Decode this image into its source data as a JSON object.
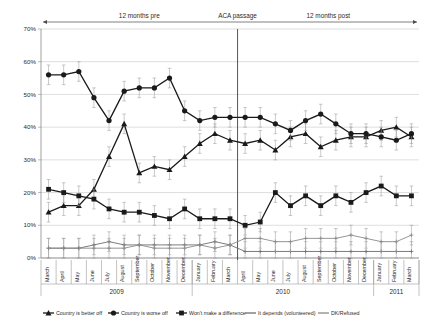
{
  "chart_data": {
    "type": "line",
    "title": "",
    "xlabel": "",
    "ylabel": "",
    "ylim": [
      0,
      70
    ],
    "ytick_labels": [
      "0%",
      "10%",
      "20%",
      "30%",
      "40%",
      "50%",
      "60%",
      "70%"
    ],
    "ytick_values": [
      0,
      10,
      20,
      30,
      40,
      50,
      60,
      70
    ],
    "grid": true,
    "legend_position": "bottom",
    "categories": [
      "March",
      "April",
      "May",
      "June",
      "July",
      "August",
      "September",
      "October",
      "November",
      "December",
      "January",
      "February",
      "March",
      "April",
      "May",
      "June",
      "July",
      "August",
      "September",
      "October",
      "November",
      "December",
      "January",
      "February",
      "March"
    ],
    "year_groups": [
      {
        "label": "2009",
        "start": 0,
        "end": 9
      },
      {
        "label": "2010",
        "start": 10,
        "end": 21
      },
      {
        "label": "2011",
        "start": 22,
        "end": 24
      }
    ],
    "annotations": [
      {
        "label": "12 months pre",
        "type": "period"
      },
      {
        "label": "ACA passage",
        "type": "marker",
        "index": 13
      },
      {
        "label": "12 months post",
        "type": "period"
      }
    ],
    "series": [
      {
        "name": "Country is better off",
        "marker": "triangle",
        "color": "#1a1a1a",
        "values": [
          14,
          16,
          16,
          21,
          31,
          41,
          26,
          28,
          27,
          31,
          35,
          38,
          36,
          35,
          36,
          33,
          37,
          38,
          34,
          36,
          37,
          37,
          39,
          40,
          37
        ]
      },
      {
        "name": "Country is worse off",
        "marker": "circle",
        "color": "#1a1a1a",
        "values": [
          56,
          56,
          57,
          49,
          42,
          51,
          52,
          52,
          55,
          45,
          42,
          43,
          43,
          43,
          43,
          41,
          39,
          42,
          44,
          41,
          38,
          38,
          37,
          36,
          38
        ]
      },
      {
        "name": "Won't make a difference",
        "marker": "square",
        "color": "#1a1a1a",
        "values": [
          21,
          20,
          19,
          18,
          15,
          14,
          14,
          13,
          12,
          15,
          12,
          12,
          12,
          10,
          11,
          20,
          16,
          19,
          16,
          19,
          17,
          20,
          22,
          19,
          19
        ]
      },
      {
        "name": "It depends (volunteered)",
        "marker": "plus",
        "color": "#6e6e6e",
        "values": [
          3,
          3,
          3,
          4,
          5,
          4,
          4,
          4,
          4,
          4,
          4,
          5,
          4,
          2,
          2,
          2,
          2,
          2,
          2,
          2,
          2,
          2,
          2,
          2,
          2
        ]
      },
      {
        "name": "DK/Refused",
        "marker": "plus",
        "color": "#8a8a8a",
        "values": [
          3,
          3,
          3,
          3,
          3,
          3,
          4,
          3,
          3,
          3,
          4,
          3,
          4,
          6,
          6,
          5,
          5,
          6,
          6,
          6,
          7,
          6,
          5,
          5,
          7
        ]
      }
    ],
    "error_bars": 3.0
  }
}
